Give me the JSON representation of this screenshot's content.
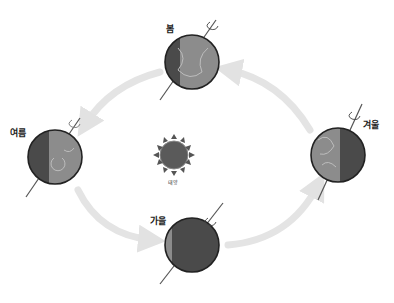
{
  "diagram": {
    "type": "earth-orbit-seasons",
    "orbit_direction": "counterclockwise",
    "sun": {
      "label": "태양",
      "color": "#5a5a5a"
    },
    "seasons": [
      {
        "label": "봄",
        "position": "top",
        "shadow": "left-narrow"
      },
      {
        "label": "여름",
        "position": "left",
        "shadow": "left-half"
      },
      {
        "label": "가을",
        "position": "bottom",
        "shadow": "mostly-dark"
      },
      {
        "label": "겨울",
        "position": "right",
        "shadow": "right-half"
      }
    ],
    "arrows": [
      {
        "from": "겨울",
        "to": "봄"
      },
      {
        "from": "봄",
        "to": "여름"
      },
      {
        "from": "여름",
        "to": "가을"
      },
      {
        "from": "가을",
        "to": "겨울"
      }
    ],
    "colors": {
      "earth_dark": "#4a4a4a",
      "earth_light": "#8c8c8c",
      "arrow": "#e4e4e4",
      "outline": "#222222"
    }
  }
}
